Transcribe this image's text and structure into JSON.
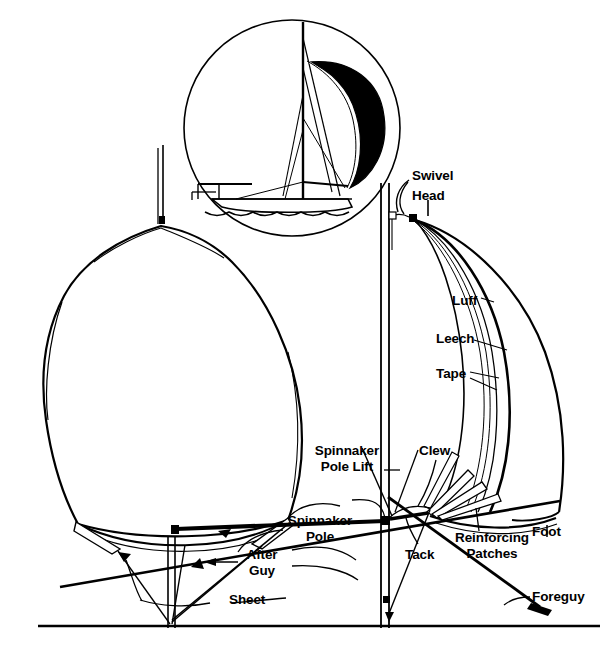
{
  "figure": {
    "type": "technical-line-diagram",
    "line_color": "#000000",
    "background_color": "#ffffff",
    "sail_fill_color": "#000000",
    "width": 607,
    "height": 645
  },
  "inset": {
    "name": "sailboat-inset",
    "description": "Circular inset showing a sailboat under spinnaker, sail filled black",
    "center_x": 292,
    "center_y": 128,
    "radius": 108
  },
  "labels": [
    {
      "id": "swivel",
      "text": "Swivel",
      "x": 412,
      "y": 176,
      "align": "left"
    },
    {
      "id": "head",
      "text": "Head",
      "x": 412,
      "y": 196,
      "align": "left"
    },
    {
      "id": "luff",
      "text": "Luff",
      "x": 453,
      "y": 300,
      "align": "left"
    },
    {
      "id": "leech",
      "text": "Leech",
      "x": 437,
      "y": 337,
      "align": "left"
    },
    {
      "id": "tape",
      "text": "Tape",
      "x": 437,
      "y": 372,
      "align": "left"
    },
    {
      "id": "spinnaker-pole-lift",
      "text": "Spinnaker\nPole Lift",
      "x": 315,
      "y": 448,
      "align": "left"
    },
    {
      "id": "clew",
      "text": "Clew",
      "x": 420,
      "y": 448,
      "align": "left"
    },
    {
      "id": "spinnaker-pole",
      "text": "Spinnaker\nPole",
      "x": 285,
      "y": 518,
      "align": "left"
    },
    {
      "id": "after-guy",
      "text": "After\nGuy",
      "x": 242,
      "y": 552,
      "align": "left"
    },
    {
      "id": "tack",
      "text": "Tack",
      "x": 407,
      "y": 552,
      "align": "left"
    },
    {
      "id": "reinforcing-patches",
      "text": "Reinforcing\nPatches",
      "x": 455,
      "y": 535,
      "align": "left"
    },
    {
      "id": "foot",
      "text": "Foot",
      "x": 533,
      "y": 529,
      "align": "left"
    },
    {
      "id": "sheet",
      "text": "Sheet",
      "x": 230,
      "y": 597,
      "align": "left"
    },
    {
      "id": "foreguy",
      "text": "Foreguy",
      "x": 533,
      "y": 594,
      "align": "left"
    }
  ],
  "parts_glossary": [
    "Swivel",
    "Head",
    "Luff",
    "Leech",
    "Tape",
    "Spinnaker Pole Lift",
    "Clew",
    "Spinnaker Pole",
    "After Guy",
    "Tack",
    "Reinforcing Patches",
    "Foot",
    "Sheet",
    "Foreguy"
  ]
}
